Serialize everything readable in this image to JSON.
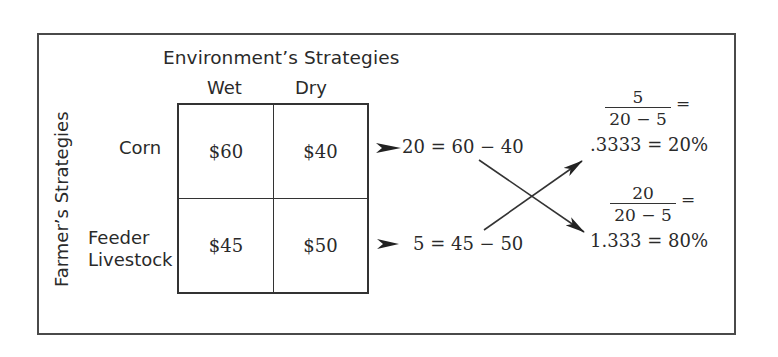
{
  "header": {
    "title": "Environment’s Strategies",
    "columns": [
      "Wet",
      "Dry"
    ]
  },
  "side_label": "Farmer’s Strategies",
  "rows": [
    {
      "label": "Corn",
      "values": [
        "$60",
        "$40"
      ],
      "difference": "20 = 60 − 40"
    },
    {
      "label": "Feeder\nLivestock",
      "label_lines": [
        "Feeder",
        "Livestock"
      ],
      "values": [
        "$45",
        "$50"
      ],
      "difference": "5 = 45 − 50"
    }
  ],
  "results": [
    {
      "numerator": "5",
      "denominator": "20 − 5",
      "equals": "=",
      "value": ".3333 = 20%"
    },
    {
      "numerator": "20",
      "denominator": "20 − 5",
      "equals": "=",
      "value": "1.333 = 80%"
    }
  ],
  "colors": {
    "line": "#333333",
    "text": "#2a2a2a",
    "background": "#ffffff"
  }
}
